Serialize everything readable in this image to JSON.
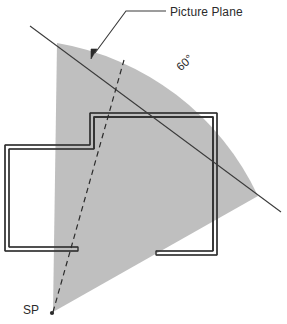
{
  "diagram": {
    "type": "architectural-perspective-setup",
    "labels": {
      "picture_plane": "Picture Plane",
      "cone_angle": "60°",
      "station_point": "SP"
    },
    "colors": {
      "cone_fill": "#bfbfbf",
      "line": "#3a3a3a",
      "wall_outer": "#6e6e6e",
      "wall_inner": "#2f2f2f",
      "text": "#2b2b2b",
      "background": "#ffffff"
    },
    "geometry": {
      "station_point": {
        "x": 53,
        "y": 312
      },
      "cone_angle_degrees": 60,
      "cone_left_edge_end": {
        "x": 57,
        "y": 43
      },
      "cone_right_edge_end": {
        "x": 258,
        "y": 196
      },
      "picture_plane_line": {
        "x1": 30,
        "y1": 26,
        "x2": 281,
        "y2": 212
      },
      "center_of_vision_line": {
        "x1": 53,
        "y1": 312,
        "x2": 124,
        "y2": 60
      },
      "leader_line": [
        {
          "x": 166,
          "y": 11
        },
        {
          "x": 126,
          "y": 11
        },
        {
          "x": 93,
          "y": 55
        }
      ]
    },
    "elements": {
      "cone": "shaded-60-degree-cone-of-vision",
      "picture_plane": "picture-plane-line",
      "center_line": "dashed-center-of-vision-line",
      "floor_plan": "building-floor-plan-double-line-walls",
      "sp_dot": "station-point-marker"
    }
  }
}
